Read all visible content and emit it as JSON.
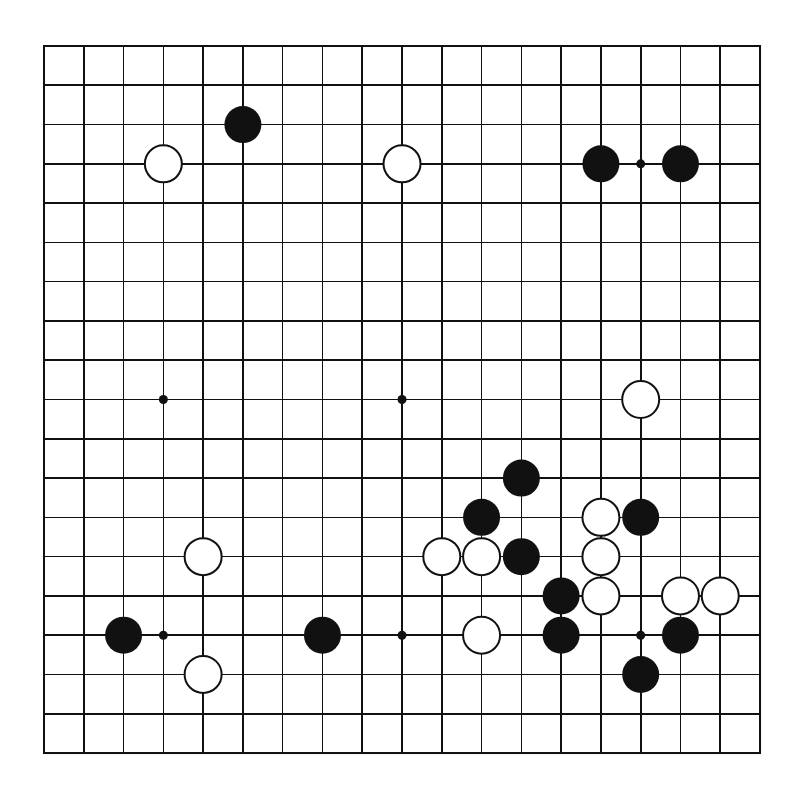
{
  "board": {
    "size": 19,
    "origin_x": 44,
    "origin_y": 46,
    "spacing_x": 39.78,
    "spacing_y": 39.28,
    "stone_radius": 18.5,
    "hoshi_radius": 4.5,
    "colors": {
      "line": "#111111",
      "background": "#ffffff",
      "black_stone": "#111111",
      "white_stone": "#ffffff"
    },
    "star_points": [
      [
        3,
        3
      ],
      [
        9,
        3
      ],
      [
        15,
        3
      ],
      [
        3,
        9
      ],
      [
        9,
        9
      ],
      [
        15,
        9
      ],
      [
        3,
        15
      ],
      [
        9,
        15
      ],
      [
        15,
        15
      ]
    ],
    "stones": [
      {
        "color": "black",
        "col": 5,
        "row": 2
      },
      {
        "color": "white",
        "col": 3,
        "row": 3
      },
      {
        "color": "white",
        "col": 9,
        "row": 3
      },
      {
        "color": "black",
        "col": 14,
        "row": 3
      },
      {
        "color": "black",
        "col": 16,
        "row": 3
      },
      {
        "color": "white",
        "col": 15,
        "row": 9
      },
      {
        "color": "black",
        "col": 12,
        "row": 11
      },
      {
        "color": "black",
        "col": 11,
        "row": 12
      },
      {
        "color": "white",
        "col": 14,
        "row": 12
      },
      {
        "color": "black",
        "col": 15,
        "row": 12
      },
      {
        "color": "white",
        "col": 4,
        "row": 13
      },
      {
        "color": "white",
        "col": 10,
        "row": 13
      },
      {
        "color": "white",
        "col": 11,
        "row": 13
      },
      {
        "color": "black",
        "col": 12,
        "row": 13
      },
      {
        "color": "white",
        "col": 14,
        "row": 13
      },
      {
        "color": "black",
        "col": 13,
        "row": 14
      },
      {
        "color": "white",
        "col": 14,
        "row": 14
      },
      {
        "color": "white",
        "col": 16,
        "row": 14
      },
      {
        "color": "white",
        "col": 17,
        "row": 14
      },
      {
        "color": "black",
        "col": 2,
        "row": 15
      },
      {
        "color": "black",
        "col": 7,
        "row": 15
      },
      {
        "color": "white",
        "col": 11,
        "row": 15
      },
      {
        "color": "black",
        "col": 13,
        "row": 15
      },
      {
        "color": "black",
        "col": 16,
        "row": 15
      },
      {
        "color": "white",
        "col": 4,
        "row": 16
      },
      {
        "color": "black",
        "col": 15,
        "row": 16
      }
    ]
  }
}
